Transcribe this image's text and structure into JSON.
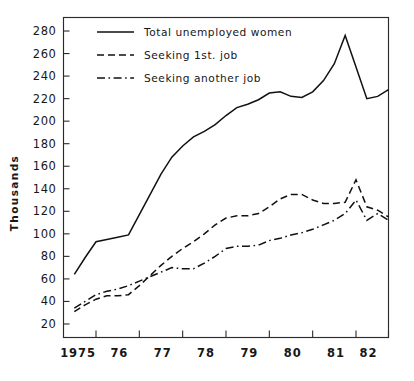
{
  "chart_data": {
    "type": "line",
    "title": "",
    "xlabel": "",
    "ylabel": "Thousands",
    "xlim": [
      1974.5,
      1982.0
    ],
    "ylim": [
      8,
      292
    ],
    "ytick_step": 20,
    "grid": false,
    "legend_position": "top-left inside plot",
    "yticks": [
      20,
      40,
      60,
      80,
      100,
      120,
      140,
      160,
      180,
      200,
      220,
      240,
      260,
      280
    ],
    "ytick_labels": [
      "20",
      "40",
      "60",
      "80",
      "100",
      "120",
      "140",
      "160",
      "180",
      "200",
      "220",
      "240",
      "260",
      "280"
    ],
    "xticks": [
      1975.25,
      1976.25,
      1977.25,
      1978.25,
      1979.25,
      1980.25,
      1981.25,
      1982.0
    ],
    "xtick_labels": [
      "1975",
      "76",
      "77",
      "78",
      "79",
      "80",
      "81",
      "82"
    ],
    "series": [
      {
        "name": "Total unemployed women",
        "style": "solid",
        "x": [
          1974.75,
          1975.0,
          1975.25,
          1975.5,
          1975.75,
          1976.0,
          1976.25,
          1976.5,
          1976.75,
          1977.0,
          1977.25,
          1977.5,
          1977.75,
          1978.0,
          1978.25,
          1978.5,
          1978.75,
          1979.0,
          1979.25,
          1979.5,
          1979.75,
          1980.0,
          1980.25,
          1980.5,
          1980.75,
          1981.0,
          1981.25,
          1981.5,
          1981.75,
          1982.0
        ],
        "values": [
          64,
          79,
          93,
          95,
          97,
          99,
          117,
          135,
          153,
          168,
          178,
          186,
          191,
          197,
          205,
          212,
          215,
          219,
          225,
          226,
          222,
          221,
          226,
          236,
          251,
          276,
          248,
          220,
          222,
          228
        ]
      },
      {
        "name": "Seeking 1st. job",
        "style": "dashed",
        "x": [
          1974.75,
          1975.0,
          1975.25,
          1975.5,
          1975.75,
          1976.0,
          1976.25,
          1976.5,
          1976.75,
          1977.0,
          1977.25,
          1977.5,
          1977.75,
          1978.0,
          1978.25,
          1978.5,
          1978.75,
          1979.0,
          1979.25,
          1979.5,
          1979.75,
          1980.0,
          1980.25,
          1980.5,
          1980.75,
          1981.0,
          1981.25,
          1981.5,
          1981.75,
          1982.0
        ],
        "values": [
          31,
          37,
          42,
          45,
          45,
          46,
          54,
          63,
          72,
          80,
          87,
          93,
          100,
          108,
          114,
          116,
          116,
          118,
          124,
          131,
          135,
          135,
          130,
          127,
          127,
          128,
          148,
          124,
          121,
          115
        ]
      },
      {
        "name": "Seeking another job",
        "style": "dashdot",
        "x": [
          1974.75,
          1975.0,
          1975.25,
          1975.5,
          1975.75,
          1976.0,
          1976.25,
          1976.5,
          1976.75,
          1977.0,
          1977.25,
          1977.5,
          1977.75,
          1978.0,
          1978.25,
          1978.5,
          1978.75,
          1979.0,
          1979.25,
          1979.5,
          1979.75,
          1980.0,
          1980.25,
          1980.5,
          1980.75,
          1981.0,
          1981.25,
          1981.5,
          1981.75,
          1982.0
        ],
        "values": [
          34,
          40,
          46,
          49,
          51,
          54,
          58,
          62,
          66,
          70,
          69,
          69,
          74,
          80,
          87,
          89,
          89,
          90,
          94,
          96,
          99,
          101,
          104,
          108,
          112,
          118,
          130,
          112,
          118,
          112
        ]
      }
    ],
    "legend": [
      {
        "label": "Total unemployed women",
        "style": "solid"
      },
      {
        "label": "Seeking 1st. job",
        "style": "dashed"
      },
      {
        "label": "Seeking another job",
        "style": "dashdot"
      }
    ],
    "colors": {
      "line": "#111111",
      "axis": "#2b2b2b",
      "background": "#ffffff"
    }
  }
}
